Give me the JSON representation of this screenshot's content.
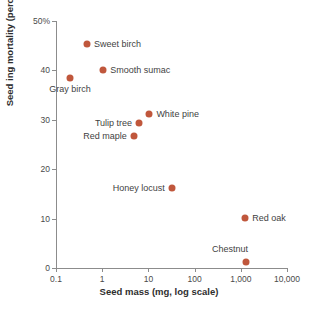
{
  "chart_data": {
    "type": "scatter",
    "title": "",
    "xlabel": "Seed mass (mg, log scale)",
    "ylabel": "Seed ing mortality (percent)",
    "xscale": "log",
    "yscale": "linear",
    "xlim": [
      0.1,
      10000
    ],
    "ylim": [
      0,
      50
    ],
    "grid": false,
    "legend": "none",
    "marker_color": "#c0573c",
    "axis_color": "#8c8c8c",
    "label_color": "#3f3f3f",
    "xticks": [
      {
        "value": 0.1,
        "label": "0.1"
      },
      {
        "value": 1,
        "label": "1"
      },
      {
        "value": 10,
        "label": "10"
      },
      {
        "value": 100,
        "label": "100"
      },
      {
        "value": 1000,
        "label": "1,000"
      },
      {
        "value": 10000,
        "label": "10,000"
      }
    ],
    "yticks": [
      {
        "value": 0,
        "label": "0"
      },
      {
        "value": 10,
        "label": "10"
      },
      {
        "value": 20,
        "label": "20"
      },
      {
        "value": 30,
        "label": "30"
      },
      {
        "value": 40,
        "label": "40"
      },
      {
        "value": 50,
        "label": "50%"
      }
    ],
    "points": [
      {
        "name": "Sweet birch",
        "x": 0.47,
        "y": 45.4,
        "label_side": "right"
      },
      {
        "name": "Smooth sumac",
        "x": 1.05,
        "y": 40.0,
        "label_side": "right"
      },
      {
        "name": "Gray birch",
        "x": 0.2,
        "y": 38.4,
        "label_side": "below"
      },
      {
        "name": "White pine",
        "x": 10.5,
        "y": 31.2,
        "label_side": "right"
      },
      {
        "name": "Tulip tree",
        "x": 6.3,
        "y": 29.4,
        "label_side": "left"
      },
      {
        "name": "Red maple",
        "x": 4.8,
        "y": 26.8,
        "label_side": "left"
      },
      {
        "name": "Honey locust",
        "x": 32.0,
        "y": 16.1,
        "label_side": "left"
      },
      {
        "name": "Red oak",
        "x": 1250.0,
        "y": 10.2,
        "label_side": "right"
      },
      {
        "name": "Chestnut",
        "x": 1300.0,
        "y": 1.3,
        "label_side": "above-left"
      }
    ]
  }
}
